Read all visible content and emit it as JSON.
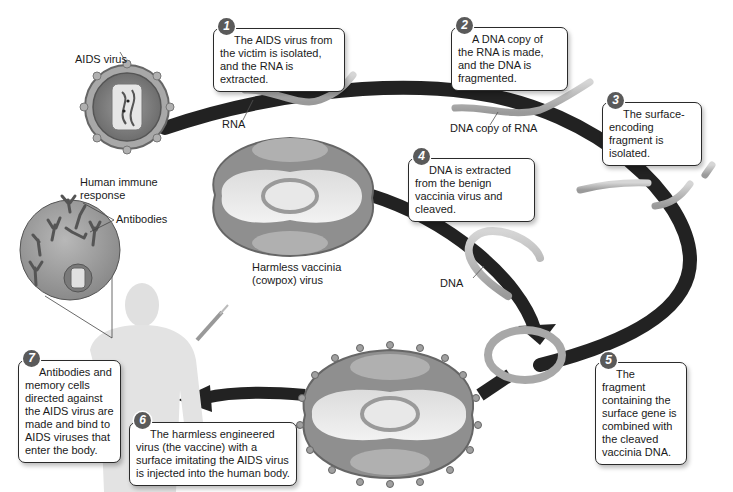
{
  "diagram": {
    "steps": [
      {
        "number": "1",
        "text": "The AIDS virus from the victim is isolated, and the RNA is extracted."
      },
      {
        "number": "2",
        "text": "A DNA copy of the RNA is made, and the DNA is fragmented."
      },
      {
        "number": "3",
        "text": "The surface-encoding fragment is isolated."
      },
      {
        "number": "4",
        "text": "DNA is extracted from the benign vaccinia virus and cleaved."
      },
      {
        "number": "5",
        "text": "The fragment containing the surface gene is combined with the cleaved vaccinia DNA."
      },
      {
        "number": "6",
        "text": "The harmless engineered virus (the vaccine) with a surface imitating the AIDS virus is injected into the human body."
      },
      {
        "number": "7",
        "text": "Antibodies and memory cells directed against the AIDS virus are made and bind to AIDS viruses that enter the body."
      }
    ],
    "labels": {
      "aids_virus": "AIDS virus",
      "rna": "RNA",
      "dna_copy": "DNA copy of RNA",
      "vaccinia_line1": "Harmless vaccinia",
      "vaccinia_line2": "(cowpox) virus",
      "dna": "DNA",
      "immune_line1": "Human immune",
      "immune_line2": "response",
      "antibodies": "Antibodies"
    },
    "colors": {
      "arrow": "#222222",
      "badge": "#5a5a5a",
      "virus_fill": "#8c8c8c",
      "capsule_light": "#e4e4e4",
      "strand": "#b5b5b5"
    }
  }
}
